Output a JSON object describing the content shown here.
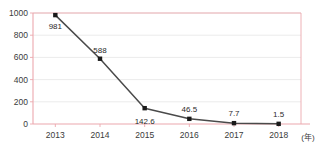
{
  "chart_data": {
    "type": "line",
    "title": "",
    "subtitle": "",
    "xlabel": "(年)",
    "ylabel": "",
    "categories": [
      "2013",
      "2014",
      "2015",
      "2016",
      "2017",
      "2018"
    ],
    "x": [
      2013,
      2014,
      2015,
      2016,
      2017,
      2018
    ],
    "values": [
      981,
      588,
      142.6,
      46.5,
      7.7,
      1.5
    ],
    "point_labels": [
      "981",
      "588",
      "142.6",
      "46.5",
      "7.7",
      "1.5"
    ],
    "series": [
      {
        "name": "series-1",
        "values": [
          981,
          588,
          142.6,
          46.5,
          7.7,
          1.5
        ],
        "marker": "square",
        "color": "#1a1a1a",
        "line_color": "#4a4a4a"
      }
    ],
    "ylim": [
      0,
      1000
    ],
    "ytick_labels": [
      "0",
      "200",
      "400",
      "600",
      "800",
      "1000"
    ],
    "ytick_values": [
      0,
      200,
      400,
      600,
      800,
      1000
    ],
    "xtick_labels": [
      "2013",
      "2014",
      "2015",
      "2016",
      "2017",
      "2018"
    ],
    "grid": true,
    "grid_axis": "y",
    "legend": false,
    "legend_position": "none",
    "annotations": []
  },
  "colors": {
    "axis": "#eca8ae",
    "grid": "#e2e2e2",
    "line": "#4a4a4a",
    "marker": "#1a1a1a",
    "text": "#3a3a3a",
    "background": "#ffffff"
  },
  "label_offsets": [
    {
      "dx": 0,
      "dy": 14
    },
    {
      "dx": 0,
      "dy": -6
    },
    {
      "dx": 0,
      "dy": 16
    },
    {
      "dx": 0,
      "dy": -7
    },
    {
      "dx": 0,
      "dy": -7
    },
    {
      "dx": 0,
      "dy": -7
    }
  ]
}
